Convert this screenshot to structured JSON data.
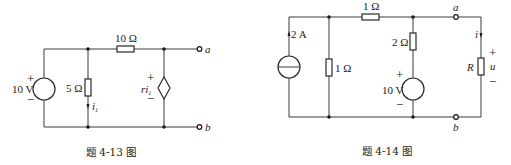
{
  "figures": [
    {
      "id": "fig-4-13",
      "caption": "题 4-13 图",
      "voltage_source": {
        "label": "10 V",
        "plus": "+",
        "minus": "−"
      },
      "resistor_shunt": {
        "label": "5 Ω"
      },
      "resistor_series": {
        "label": "10 Ω"
      },
      "current": {
        "label": "i",
        "subscript": "1"
      },
      "dependent_source": {
        "label": "ri",
        "subscript": "1",
        "plus": "+",
        "minus": "−"
      },
      "terminal_a": "a",
      "terminal_b": "b"
    },
    {
      "id": "fig-4-14",
      "caption": "题 4-14 图",
      "current_source": {
        "label": "2 A"
      },
      "resistor_shunt": {
        "label": "1 Ω"
      },
      "resistor_series": {
        "label": "1 Ω"
      },
      "resistor_branch": {
        "label": "2 Ω"
      },
      "voltage_source": {
        "label": "10 V",
        "plus": "+",
        "minus": "−"
      },
      "load": {
        "label": "R",
        "current": "i",
        "voltage": "u",
        "plus": "+",
        "minus": "−"
      },
      "terminal_a": "a",
      "terminal_b": "b"
    }
  ]
}
